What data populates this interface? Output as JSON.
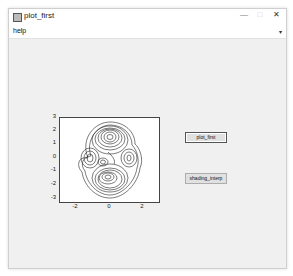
{
  "window": {
    "title": "plot_first",
    "controls": {
      "minimize": "—",
      "maximize": "□",
      "close": "✕"
    }
  },
  "menubar": {
    "items": [
      {
        "label": "help"
      }
    ],
    "overflow_arrow": "▾"
  },
  "axes": {
    "yticks": [
      "3",
      "2",
      "1",
      "0",
      "-1",
      "-2",
      "-3"
    ],
    "xticks": [
      "-2",
      "0",
      "2"
    ]
  },
  "buttons": {
    "plot_first": "plot_first",
    "shading_interp": "shading_interp"
  }
}
